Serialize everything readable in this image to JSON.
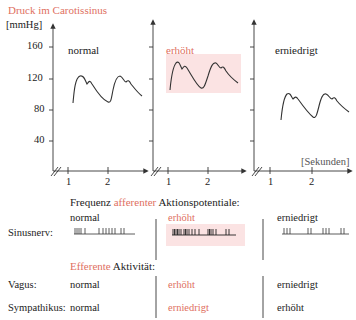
{
  "title": "Druck im Carotissinus",
  "colors": {
    "accent_red": "#e0705f",
    "highlight_box": "#fbe3e3",
    "line": "#333333"
  },
  "y_axis": {
    "unit_label": "[mmHg]",
    "ticks": [
      "160",
      "120",
      "80",
      "40"
    ]
  },
  "x_axis": {
    "unit_label": "[Sekunden]",
    "ticks": [
      "1",
      "2"
    ]
  },
  "panels": [
    {
      "label": "normal",
      "highlight": false
    },
    {
      "label": "erhöht",
      "highlight": true
    },
    {
      "label": "erniedrigt",
      "highlight": false
    }
  ],
  "afferent": {
    "heading_prefix": "Frequenz ",
    "heading_accent": "afferenter",
    "heading_suffix": " Aktionspotentiale:",
    "row_label": "Sinusnerv:",
    "columns": [
      "normal",
      "erhöht",
      "erniedrigt"
    ]
  },
  "efferent": {
    "heading_accent": "Efferente",
    "heading_suffix": " Aktivität:",
    "rows": [
      {
        "label": "Vagus:",
        "values": [
          "normal",
          "erhöht",
          "erniedrigt"
        ]
      },
      {
        "label": "Sympathikus:",
        "values": [
          "normal",
          "erniedrigt",
          "erhöht"
        ]
      }
    ]
  }
}
